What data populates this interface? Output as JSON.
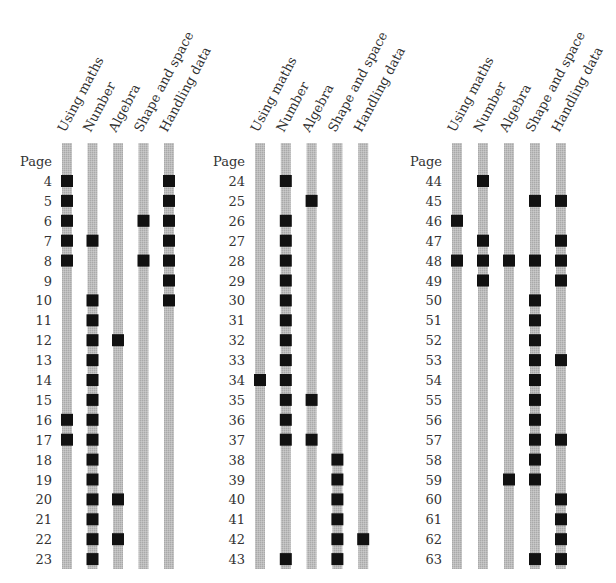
{
  "chart_data": {
    "type": "table",
    "title": "",
    "row_header_label": "Page",
    "categories": [
      "Using maths",
      "Number",
      "Algebra",
      "Shape and space",
      "Handling data"
    ],
    "colors": {
      "bar": "#b8b8b8",
      "mark": "#111111",
      "text": "#333333"
    },
    "groups": [
      {
        "pages": [
          4,
          5,
          6,
          7,
          8,
          9,
          10,
          11,
          12,
          13,
          14,
          15,
          16,
          17,
          18,
          19,
          20,
          21,
          22,
          23
        ],
        "marks": [
          [
            1,
            0,
            0,
            0,
            1
          ],
          [
            1,
            0,
            0,
            0,
            1
          ],
          [
            1,
            0,
            0,
            1,
            1
          ],
          [
            1,
            1,
            0,
            0,
            1
          ],
          [
            1,
            0,
            0,
            1,
            1
          ],
          [
            0,
            0,
            0,
            0,
            1
          ],
          [
            0,
            1,
            0,
            0,
            1
          ],
          [
            0,
            1,
            0,
            0,
            0
          ],
          [
            0,
            1,
            1,
            0,
            0
          ],
          [
            0,
            1,
            0,
            0,
            0
          ],
          [
            0,
            1,
            0,
            0,
            0
          ],
          [
            0,
            1,
            0,
            0,
            0
          ],
          [
            1,
            1,
            0,
            0,
            0
          ],
          [
            1,
            1,
            0,
            0,
            0
          ],
          [
            0,
            1,
            0,
            0,
            0
          ],
          [
            0,
            1,
            0,
            0,
            0
          ],
          [
            0,
            1,
            1,
            0,
            0
          ],
          [
            0,
            1,
            0,
            0,
            0
          ],
          [
            0,
            1,
            1,
            0,
            0
          ],
          [
            0,
            1,
            0,
            0,
            0
          ]
        ]
      },
      {
        "pages": [
          24,
          25,
          26,
          27,
          28,
          29,
          30,
          31,
          32,
          33,
          34,
          35,
          36,
          37,
          38,
          39,
          40,
          41,
          42,
          43
        ],
        "marks": [
          [
            0,
            1,
            0,
            0,
            0
          ],
          [
            0,
            0,
            1,
            0,
            0
          ],
          [
            0,
            1,
            0,
            0,
            0
          ],
          [
            0,
            1,
            0,
            0,
            0
          ],
          [
            0,
            1,
            0,
            0,
            0
          ],
          [
            0,
            1,
            0,
            0,
            0
          ],
          [
            0,
            1,
            0,
            0,
            0
          ],
          [
            0,
            1,
            0,
            0,
            0
          ],
          [
            0,
            1,
            0,
            0,
            0
          ],
          [
            0,
            1,
            0,
            0,
            0
          ],
          [
            1,
            1,
            0,
            0,
            0
          ],
          [
            0,
            1,
            1,
            0,
            0
          ],
          [
            0,
            1,
            0,
            0,
            0
          ],
          [
            0,
            1,
            1,
            0,
            0
          ],
          [
            0,
            0,
            0,
            1,
            0
          ],
          [
            0,
            0,
            0,
            1,
            0
          ],
          [
            0,
            0,
            0,
            1,
            0
          ],
          [
            0,
            0,
            0,
            1,
            0
          ],
          [
            0,
            0,
            0,
            1,
            1
          ],
          [
            0,
            1,
            0,
            1,
            0
          ]
        ]
      },
      {
        "pages": [
          44,
          45,
          46,
          47,
          48,
          49,
          50,
          51,
          52,
          53,
          54,
          55,
          56,
          57,
          58,
          59,
          60,
          61,
          62,
          63
        ],
        "marks": [
          [
            0,
            1,
            0,
            0,
            0
          ],
          [
            0,
            0,
            0,
            1,
            1
          ],
          [
            1,
            0,
            0,
            0,
            0
          ],
          [
            0,
            1,
            0,
            0,
            1
          ],
          [
            1,
            1,
            1,
            1,
            1
          ],
          [
            0,
            1,
            0,
            0,
            1
          ],
          [
            0,
            0,
            0,
            1,
            0
          ],
          [
            0,
            0,
            0,
            1,
            0
          ],
          [
            0,
            0,
            0,
            1,
            0
          ],
          [
            0,
            0,
            0,
            1,
            1
          ],
          [
            0,
            0,
            0,
            1,
            0
          ],
          [
            0,
            0,
            0,
            1,
            0
          ],
          [
            0,
            0,
            0,
            1,
            0
          ],
          [
            0,
            0,
            0,
            1,
            1
          ],
          [
            0,
            0,
            0,
            1,
            0
          ],
          [
            0,
            0,
            1,
            1,
            0
          ],
          [
            0,
            0,
            0,
            0,
            1
          ],
          [
            0,
            0,
            0,
            0,
            1
          ],
          [
            0,
            0,
            0,
            0,
            1
          ],
          [
            0,
            0,
            0,
            1,
            1
          ]
        ]
      }
    ]
  }
}
